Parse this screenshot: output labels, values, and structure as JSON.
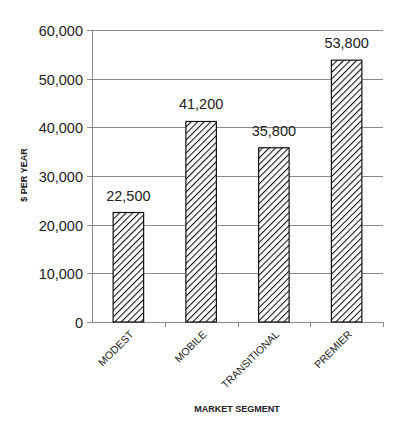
{
  "chart_data": {
    "type": "bar",
    "title": "",
    "xlabel": "MARKET SEGMENT",
    "ylabel": "$ PER YEAR",
    "categories": [
      "MODEST",
      "MOBILE",
      "TRANSITIONAL",
      "PREMIER"
    ],
    "values": [
      22500,
      41200,
      35800,
      53800
    ],
    "value_labels": [
      "22,500",
      "41,200",
      "35,800",
      "53,800"
    ],
    "ylim": [
      0,
      60000
    ],
    "yticks": [
      0,
      10000,
      20000,
      30000,
      40000,
      50000,
      60000
    ],
    "ytick_labels": [
      "0",
      "10,000",
      "20,000",
      "30,000",
      "40,000",
      "50,000",
      "60,000"
    ],
    "grid": true,
    "legend": null,
    "bar_fill": "diagonal-hatch",
    "colors": {
      "bar_stroke": "#111111",
      "hatch": "#111111",
      "grid": "#8a8a8a",
      "axis": "#8a8a8a",
      "text": "#222222"
    }
  }
}
